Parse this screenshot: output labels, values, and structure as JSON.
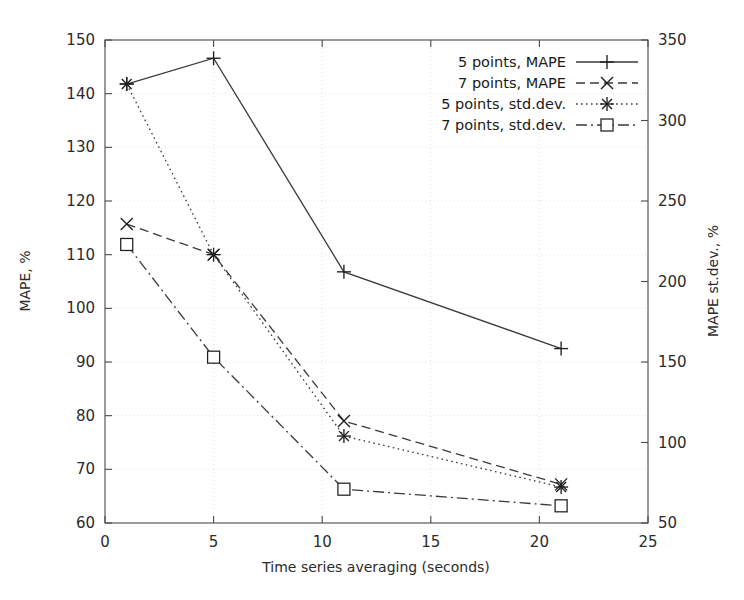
{
  "chart_data": {
    "type": "line",
    "title": "",
    "xlabel": "Time series averaging (seconds)",
    "ylabel": "MAPE, %",
    "y2label": "MAPE st.dev., %",
    "xlim": [
      0,
      25
    ],
    "ylim": [
      60,
      150
    ],
    "y2lim": [
      50,
      350
    ],
    "xticks": [
      0,
      5,
      10,
      15,
      20,
      25
    ],
    "yticks": [
      60,
      70,
      80,
      90,
      100,
      110,
      120,
      130,
      140,
      150
    ],
    "y2ticks": [
      50,
      100,
      150,
      200,
      250,
      300,
      350
    ],
    "grid": true,
    "legend_position": "top-right",
    "x": [
      1,
      5,
      11,
      21
    ],
    "series": [
      {
        "name": "5 points, MAPE",
        "axis": "left",
        "linestyle": "solid",
        "marker": "plus",
        "values": [
          141.8,
          146.6,
          106.8,
          92.5
        ]
      },
      {
        "name": "7 points, MAPE",
        "axis": "left",
        "linestyle": "dashed",
        "marker": "x",
        "values": [
          115.7,
          110.0,
          79.0,
          67.2
        ]
      },
      {
        "name": "5 points, std.dev.",
        "axis": "right",
        "linestyle": "dotted",
        "marker": "asterisk",
        "values": [
          323,
          217,
          104,
          72
        ],
        "left_scale_positions": [
          141.8,
          110.0,
          76.2,
          66.7
        ]
      },
      {
        "name": "7 points, std.dev.",
        "axis": "right",
        "linestyle": "dashdot",
        "marker": "square",
        "values": [
          223,
          153,
          71,
          61
        ],
        "left_scale_positions": [
          111.9,
          90.9,
          66.3,
          63.2
        ]
      }
    ]
  },
  "legend": {
    "entries": [
      {
        "label": "5 points, MAPE"
      },
      {
        "label": "7 points, MAPE"
      },
      {
        "label": "5 points, std.dev."
      },
      {
        "label": "7 points, std.dev."
      }
    ]
  },
  "axes": {
    "x_tick_labels": [
      "0",
      "5",
      "10",
      "15",
      "20",
      "25"
    ],
    "y_tick_labels": [
      "60",
      "70",
      "80",
      "90",
      "100",
      "110",
      "120",
      "130",
      "140",
      "150"
    ],
    "y2_tick_labels": [
      "50",
      "100",
      "150",
      "200",
      "250",
      "300",
      "350"
    ],
    "x_title": "Time series averaging (seconds)",
    "y_title": "MAPE, %",
    "y2_title": "MAPE st.dev., %"
  },
  "colors": {
    "line": "#3a3a3a",
    "marker": "#1f1f1f",
    "frame": "#4a4a4a",
    "grid": "#d8d8d8",
    "text": "#1a1a1a",
    "background": "#ffffff"
  }
}
